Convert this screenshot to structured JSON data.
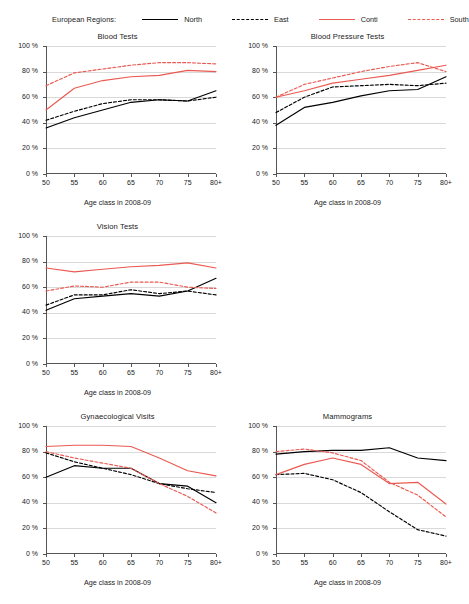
{
  "legend": {
    "title": "European Regions:",
    "items": [
      {
        "label": "North",
        "style": "solid",
        "color": "#000000",
        "key": "north"
      },
      {
        "label": "East",
        "style": "dashed",
        "color": "#000000",
        "key": "east"
      },
      {
        "label": "Conti",
        "style": "solid",
        "color": "#ea5a52",
        "key": "conti"
      },
      {
        "label": "South",
        "style": "dashed",
        "color": "#ea5a52",
        "key": "south"
      }
    ]
  },
  "axes": {
    "x_label": "Age class in 2008-09",
    "x_ticks": [
      "50",
      "55",
      "60",
      "65",
      "70",
      "75",
      "80+"
    ],
    "y_ticks": [
      "0 %",
      "20 %",
      "40 %",
      "60 %",
      "80 %",
      "100 %"
    ],
    "y_values": [
      0,
      20,
      40,
      60,
      80,
      100
    ],
    "ylim": [
      0,
      100
    ]
  },
  "colors": {
    "black": "#000000",
    "red": "#ea5a52",
    "gridline": "#d9d9d9",
    "axis": "#555555",
    "text": "#222222",
    "background": "#ffffff"
  },
  "chart_data": [
    {
      "type": "line",
      "title": "Blood Tests",
      "xlabel": "Age class in 2008-09",
      "ylabel": "",
      "categories": [
        "50",
        "55",
        "60",
        "65",
        "70",
        "75",
        "80+"
      ],
      "ylim": [
        0,
        100
      ],
      "grid": true,
      "legend_position": "top",
      "series": [
        {
          "name": "North",
          "color": "#000000",
          "style": "solid",
          "values": [
            36,
            44,
            50,
            56,
            58,
            57,
            65
          ]
        },
        {
          "name": "East",
          "color": "#000000",
          "style": "dashed",
          "values": [
            42,
            49,
            55,
            58,
            58,
            57,
            60
          ]
        },
        {
          "name": "Conti",
          "color": "#ea5a52",
          "style": "solid",
          "values": [
            50,
            67,
            73,
            76,
            77,
            81,
            80
          ]
        },
        {
          "name": "South",
          "color": "#ea5a52",
          "style": "dashed",
          "values": [
            69,
            79,
            82,
            85,
            87,
            87,
            86
          ]
        }
      ]
    },
    {
      "type": "line",
      "title": "Blood Pressure Tests",
      "xlabel": "Age class in 2008-09",
      "ylabel": "",
      "categories": [
        "50",
        "55",
        "60",
        "65",
        "70",
        "75",
        "80+"
      ],
      "ylim": [
        0,
        100
      ],
      "grid": true,
      "legend_position": "top",
      "series": [
        {
          "name": "North",
          "color": "#000000",
          "style": "solid",
          "values": [
            38,
            52,
            56,
            61,
            65,
            66,
            76
          ]
        },
        {
          "name": "East",
          "color": "#000000",
          "style": "dashed",
          "values": [
            48,
            60,
            68,
            69,
            70,
            69,
            71
          ]
        },
        {
          "name": "Conti",
          "color": "#ea5a52",
          "style": "solid",
          "values": [
            60,
            65,
            71,
            74,
            77,
            81,
            85
          ]
        },
        {
          "name": "South",
          "color": "#ea5a52",
          "style": "dashed",
          "values": [
            60,
            70,
            75,
            80,
            84,
            87,
            80
          ]
        }
      ]
    },
    {
      "type": "line",
      "title": "Vision Tests",
      "xlabel": "Age class in 2008-09",
      "ylabel": "",
      "categories": [
        "50",
        "55",
        "60",
        "65",
        "70",
        "75",
        "80+"
      ],
      "ylim": [
        0,
        100
      ],
      "grid": true,
      "legend_position": "top",
      "series": [
        {
          "name": "North",
          "color": "#000000",
          "style": "solid",
          "values": [
            42,
            51,
            53,
            55,
            53,
            57,
            67
          ]
        },
        {
          "name": "East",
          "color": "#000000",
          "style": "dashed",
          "values": [
            46,
            54,
            54,
            58,
            55,
            57,
            54
          ]
        },
        {
          "name": "Conti",
          "color": "#ea5a52",
          "style": "solid",
          "values": [
            75,
            72,
            74,
            76,
            77,
            79,
            75
          ]
        },
        {
          "name": "South",
          "color": "#ea5a52",
          "style": "dashed",
          "values": [
            57,
            61,
            60,
            64,
            64,
            60,
            59
          ]
        }
      ]
    },
    {
      "type": "line",
      "title": "Gynaecological Visits",
      "xlabel": "Age class in 2008-09",
      "ylabel": "",
      "categories": [
        "50",
        "55",
        "60",
        "65",
        "70",
        "75",
        "80+"
      ],
      "ylim": [
        0,
        100
      ],
      "grid": true,
      "legend_position": "top",
      "series": [
        {
          "name": "North",
          "color": "#000000",
          "style": "solid",
          "values": [
            60,
            69,
            67,
            67,
            55,
            53,
            40
          ]
        },
        {
          "name": "East",
          "color": "#000000",
          "style": "dashed",
          "values": [
            79,
            72,
            67,
            62,
            55,
            51,
            48
          ]
        },
        {
          "name": "Conti",
          "color": "#ea5a52",
          "style": "solid",
          "values": [
            84,
            85,
            85,
            84,
            75,
            65,
            61
          ]
        },
        {
          "name": "South",
          "color": "#ea5a52",
          "style": "dashed",
          "values": [
            80,
            75,
            71,
            67,
            55,
            45,
            32
          ]
        }
      ]
    },
    {
      "type": "line",
      "title": "Mammograms",
      "xlabel": "Age class in 2008-09",
      "ylabel": "",
      "categories": [
        "50",
        "55",
        "60",
        "65",
        "70",
        "75",
        "80+"
      ],
      "ylim": [
        0,
        100
      ],
      "grid": true,
      "legend_position": "top",
      "series": [
        {
          "name": "North",
          "color": "#000000",
          "style": "solid",
          "values": [
            78,
            80,
            81,
            81,
            83,
            75,
            73
          ]
        },
        {
          "name": "East",
          "color": "#000000",
          "style": "dashed",
          "values": [
            62,
            63,
            58,
            48,
            33,
            19,
            14
          ]
        },
        {
          "name": "Conti",
          "color": "#ea5a52",
          "style": "solid",
          "values": [
            62,
            70,
            75,
            70,
            55,
            56,
            39
          ]
        },
        {
          "name": "South",
          "color": "#ea5a52",
          "style": "dashed",
          "values": [
            80,
            82,
            79,
            73,
            56,
            46,
            29
          ]
        }
      ]
    }
  ]
}
